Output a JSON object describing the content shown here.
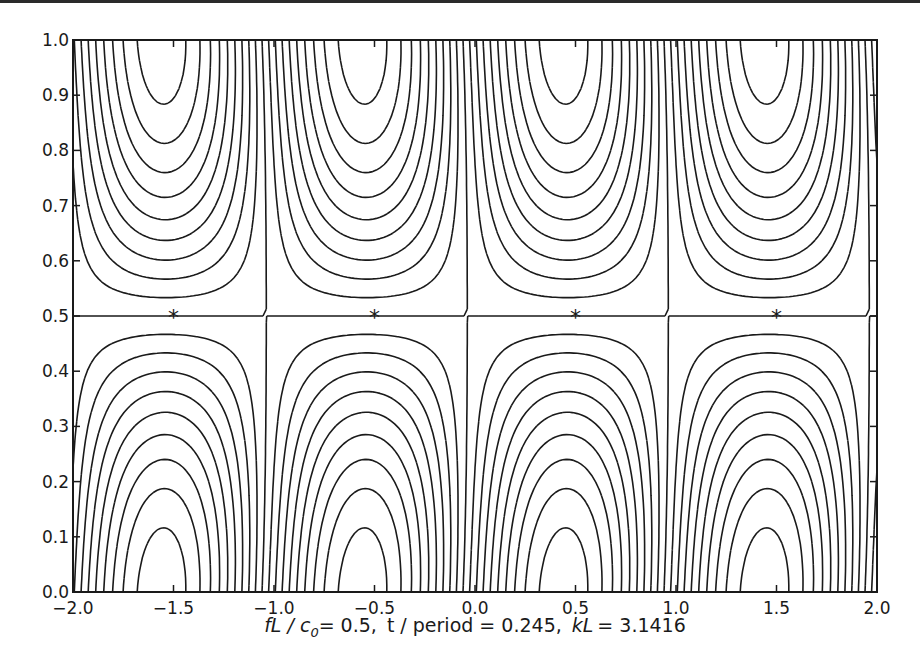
{
  "chart_data": {
    "type": "contour",
    "title": "",
    "xlabel": "fL / c0 = 0.5,  t / period = 0.245,  kL = 3.1416",
    "xlabel_parts": {
      "param1_name": "fL / c",
      "param1_sub": "0",
      "param1_value": "= 0.5,",
      "param2": "t / period = 0.245,",
      "param3_name": "kL",
      "param3_value": "= 3.1416"
    },
    "ylabel": "",
    "xlim": [
      -2.0,
      2.0
    ],
    "ylim": [
      0.0,
      1.0
    ],
    "x_ticks": [
      "−2.0",
      "−1.5",
      "−1.0",
      "−0.5",
      "0.0",
      "0.5",
      "1.0",
      "1.5",
      "2.0"
    ],
    "x_tick_values": [
      -2.0,
      -1.5,
      -1.0,
      -0.5,
      0.0,
      0.5,
      1.0,
      1.5,
      2.0
    ],
    "y_ticks": [
      "0.0",
      "0.1",
      "0.2",
      "0.3",
      "0.4",
      "0.5",
      "0.6",
      "0.7",
      "0.8",
      "0.9",
      "1.0"
    ],
    "y_tick_values": [
      0.0,
      0.1,
      0.2,
      0.3,
      0.4,
      0.5,
      0.6,
      0.7,
      0.8,
      0.9,
      1.0
    ],
    "grid": false,
    "legend": null,
    "line_styles": {
      "positive": "solid",
      "negative": "dashed"
    },
    "markers": [
      {
        "x": -1.5,
        "y": 0.5,
        "symbol": "*"
      },
      {
        "x": -0.5,
        "y": 0.5,
        "symbol": "*"
      },
      {
        "x": 0.5,
        "y": 0.5,
        "symbol": "*"
      },
      {
        "x": 1.5,
        "y": 0.5,
        "symbol": "*"
      }
    ],
    "contour_levels_count": 18,
    "pattern": "alternating cells of period 2 in x: solid arches rise from bottom at x=-1.5 and 0.5, descend from top at x=-0.5 and 1.5; dashed arches descend from top at x=-1.5 and 0.5, rise from bottom at x=-0.5 and 1.5; saddle points marked with stars at y=0.5"
  },
  "colors": {
    "line": "#1a1a1a",
    "background": "#ffffff"
  }
}
